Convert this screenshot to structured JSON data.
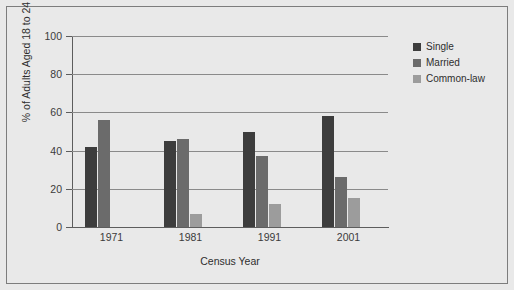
{
  "chart_data": {
    "type": "bar",
    "title": "",
    "subtitle": "",
    "xlabel": "Census Year",
    "ylabel": "% of Adults Aged 18 to 24",
    "categories": [
      "1971",
      "1981",
      "1991",
      "2001"
    ],
    "series": [
      {
        "name": "Single",
        "color": "#3d3d3d",
        "values": [
          42,
          45,
          50,
          58
        ]
      },
      {
        "name": "Married",
        "color": "#6b6b6b",
        "values": [
          56,
          46,
          37,
          26
        ]
      },
      {
        "name": "Common-law",
        "color": "#9c9c9c",
        "values": [
          null,
          7,
          12,
          15
        ]
      }
    ],
    "ylim": [
      0,
      100
    ],
    "yticks": [
      "0",
      "20",
      "40",
      "60",
      "80",
      "100"
    ],
    "ytick_values": [
      0,
      20,
      40,
      60,
      80,
      100
    ],
    "grid": "horizontal",
    "legend_position": "top-right-outside",
    "background_color": "#e9e9e9",
    "gridline_color": "#8a8a8a",
    "axis_color": "#5d5d5d",
    "border_color": "#7d7d7d"
  },
  "legend": {
    "items": [
      {
        "label": "Single"
      },
      {
        "label": "Married"
      },
      {
        "label": "Common-law"
      }
    ]
  }
}
